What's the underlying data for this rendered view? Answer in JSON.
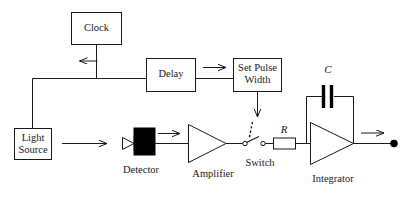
{
  "diagram": {
    "type": "block-diagram",
    "background": "#ffffff",
    "line_color": "#1a1a1a"
  },
  "blocks": {
    "clock": {
      "label": "Clock",
      "x": 71,
      "y": 12,
      "w": 51,
      "h": 33
    },
    "delay": {
      "label": "Delay",
      "x": 146,
      "y": 58,
      "w": 50,
      "h": 34
    },
    "set_pulse_width": {
      "label_line1": "Set Pulse",
      "label_line2": "Width",
      "x": 233,
      "y": 58,
      "w": 49,
      "h": 34
    },
    "light_source": {
      "label_line1": "Light",
      "label_line2": "Source",
      "x": 14,
      "y": 128,
      "w": 38,
      "h": 32
    }
  },
  "components": {
    "detector": {
      "label": "Detector",
      "kind": "photodiode-black-box"
    },
    "amplifier": {
      "label": "Amplifier",
      "kind": "triangle-amp"
    },
    "switch": {
      "label": "Switch",
      "kind": "spst-switch"
    },
    "resistor": {
      "label": "R",
      "kind": "resistor-box"
    },
    "capacitor": {
      "label": "C",
      "kind": "capacitor-plates"
    },
    "integrator": {
      "label": "Integrator",
      "kind": "triangle-opamp"
    },
    "output_node": {
      "label": "",
      "kind": "terminal-dot"
    }
  },
  "arrows": {
    "clock_down": "arrow-down",
    "delay_to_pulse": "arrow-right",
    "pulse_down_to_switch": "arrow-down",
    "light_to_detector": "arrow-right",
    "detector_to_amplifier": "arrow-right",
    "integrator_output": "arrow-right"
  }
}
